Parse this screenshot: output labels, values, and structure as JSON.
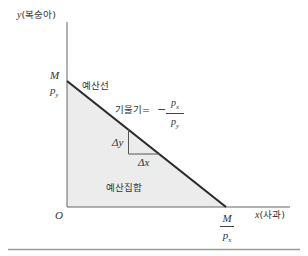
{
  "diagram": {
    "type": "budget-constraint",
    "y_axis": {
      "var": "y",
      "label": "(복숭아)"
    },
    "x_axis": {
      "var": "x",
      "label": "(사과)"
    },
    "origin": "O",
    "y_intercept": {
      "num": "M",
      "den": "p",
      "den_sub": "y"
    },
    "x_intercept": {
      "num": "M",
      "den": "p",
      "den_sub": "x"
    },
    "budget_line_label": "예산선",
    "slope": {
      "label": "기울기=",
      "sign": "−",
      "num": "p",
      "num_sub": "x",
      "den": "p",
      "den_sub": "y"
    },
    "delta_y": "Δy",
    "delta_x": "Δx",
    "budget_set_label": "예산집합",
    "colors": {
      "fill": "#ececec",
      "line": "#2b2b2b",
      "axis": "#666666",
      "rule": "#9a9a9a"
    }
  }
}
